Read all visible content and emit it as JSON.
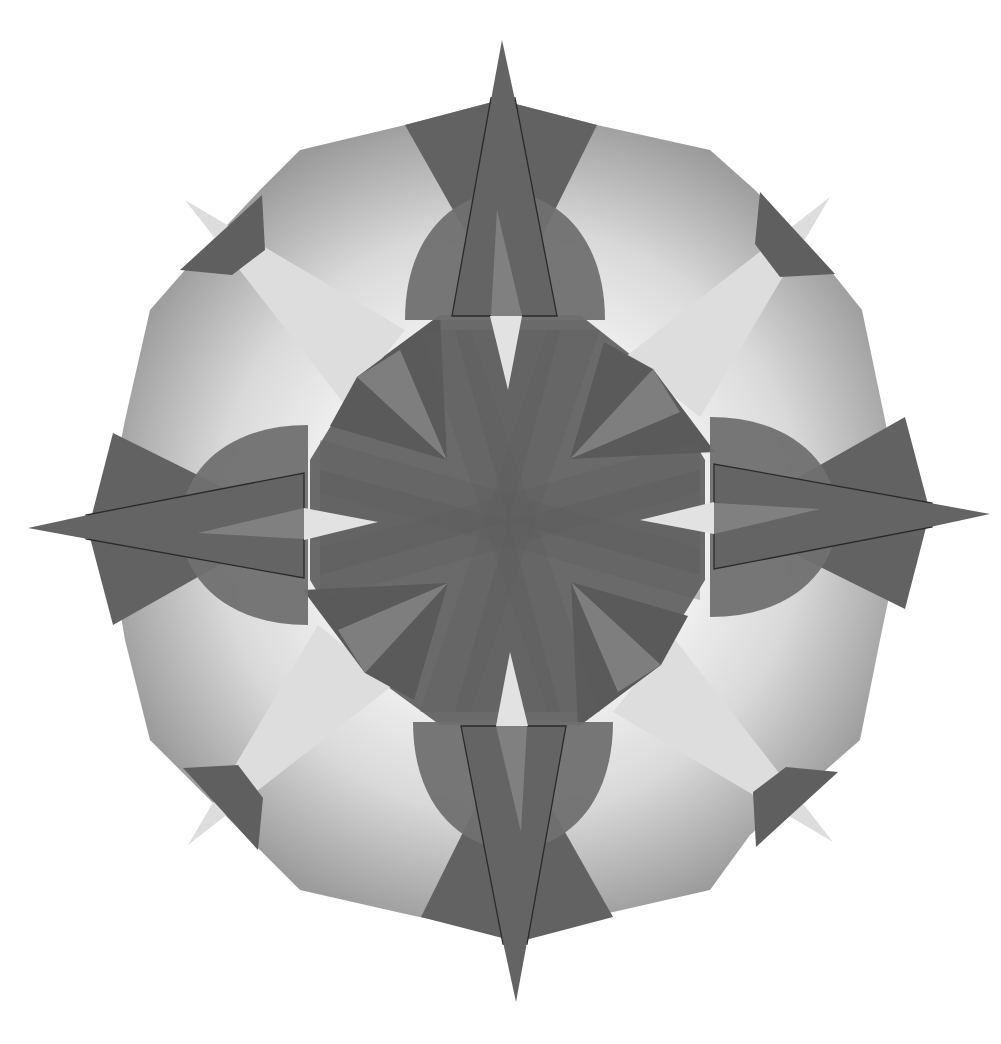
{
  "artwork": {
    "title": "Geometric compass-star quilt mandala",
    "symmetry": "4-fold rotational",
    "center": [
      509,
      521
    ],
    "colors": {
      "background": "#ffffff",
      "outer_panel_light": "#f4f4f4",
      "outer_panel_dark": "#8e8e8e",
      "dark_wedge": "#626262",
      "medium_band": "#6e6e6e",
      "lobe": "#747474",
      "light_star_point": "#dcdcdc",
      "inner_facet_light": "#808080",
      "inner_facet_dark": "#595959",
      "outline": "#2a2a2a",
      "center_hole": "#e2e2e2"
    },
    "elements": [
      "outer dodecagon panels with radial gradient",
      "four dark compass spikes (N, E, S, W)",
      "four light diagonal star points (NE, SE, SW, NW)",
      "four semicircular lobes behind compass arms",
      "central octagon of overlapping dark bands",
      "outlined trapezoid arms with inner light slivers"
    ]
  }
}
